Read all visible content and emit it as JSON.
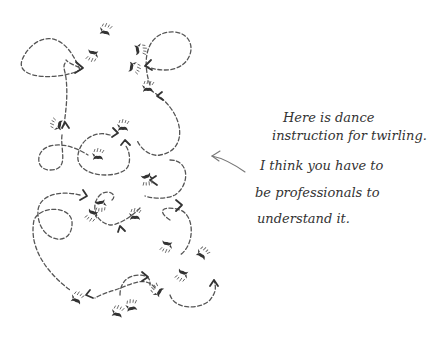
{
  "illustration": {
    "subject": "dance step diagram with dashed twirling paths, arrows and footprints",
    "colors": {
      "background": "#ffffff",
      "ink": "#333333",
      "path": "#555555"
    }
  },
  "caption": {
    "lines": [
      "Here is dance",
      "instruction for twirling.",
      "I think you have to",
      "be professionals to",
      "understand it."
    ]
  }
}
